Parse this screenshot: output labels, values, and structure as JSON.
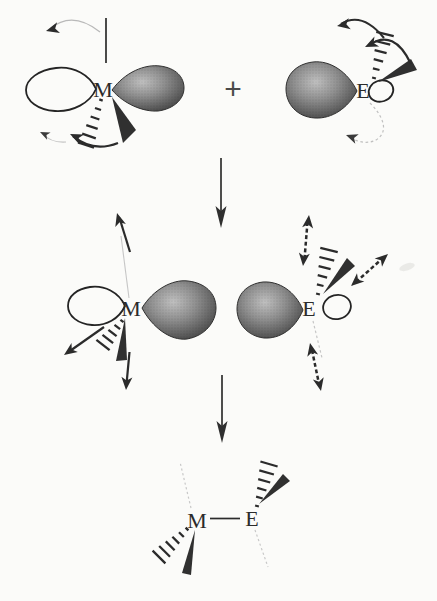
{
  "figure": {
    "reactants": {
      "metal_fragment": {
        "atom_label": "M"
      },
      "plus_sign": "+",
      "main_group_fragment": {
        "atom_label": "E"
      }
    },
    "intermediate": {
      "metal_atom_label": "M",
      "main_group_atom_label": "E"
    },
    "product": {
      "metal_atom_label": "M",
      "main_group_atom_label": "E"
    }
  },
  "colors": {
    "ink": "#2b2b2b",
    "faint_line": "#bdbdbd",
    "lobe_highlight": "#c0c0c0",
    "lobe_mid": "#7c7c7c",
    "lobe_edge": "#3a3a3a",
    "background": "#fbfbf9"
  }
}
